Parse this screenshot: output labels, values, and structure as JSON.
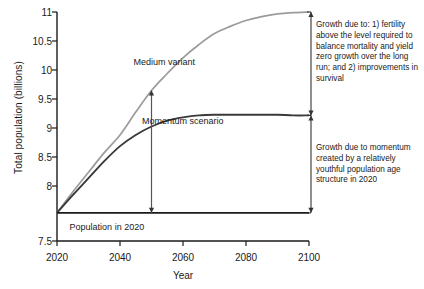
{
  "chart_data": {
    "type": "line",
    "title": "",
    "xlabel": "Year",
    "ylabel": "Total population (billions)",
    "xlim": [
      2020,
      2100
    ],
    "ylim": [
      7.5,
      11
    ],
    "grid": false,
    "legend_position": "inline-labels",
    "xticks": [
      "2020",
      "2040",
      "2060",
      "2080",
      "2100"
    ],
    "xtick_values": [
      2020,
      2040,
      2060,
      2080,
      2100
    ],
    "yticks": [
      "7.5",
      "8",
      "8.5",
      "9",
      "9.5",
      "10",
      "10.5",
      "11"
    ],
    "ytick_values": [
      7.5,
      8,
      8.5,
      9,
      9.5,
      10,
      10.5,
      11
    ],
    "x": [
      2020,
      2025,
      2030,
      2035,
      2040,
      2045,
      2050,
      2055,
      2060,
      2065,
      2070,
      2075,
      2080,
      2085,
      2090,
      2095,
      2100
    ],
    "series": [
      {
        "name": "Medium variant",
        "color": "#9b9b9b",
        "values": [
          7.93,
          8.25,
          8.55,
          8.85,
          9.12,
          9.47,
          9.8,
          10.06,
          10.3,
          10.5,
          10.67,
          10.78,
          10.87,
          10.93,
          10.97,
          10.99,
          11.0
        ]
      },
      {
        "name": "Momentum scenario",
        "color": "#3a3a3a",
        "values": [
          7.93,
          8.2,
          8.46,
          8.72,
          8.95,
          9.12,
          9.25,
          9.34,
          9.39,
          9.42,
          9.43,
          9.43,
          9.43,
          9.43,
          9.43,
          9.42,
          9.42
        ]
      },
      {
        "name": "Population in 2020",
        "color": "#1a1a1a",
        "values": [
          7.93,
          7.93,
          7.93,
          7.93,
          7.93,
          7.93,
          7.93,
          7.93,
          7.93,
          7.93,
          7.93,
          7.93,
          7.93,
          7.93,
          7.93,
          7.93,
          7.93
        ]
      }
    ],
    "annotations": [
      {
        "id": "medium-variant-label",
        "text": "Medium variant",
        "x": 2050,
        "y": 10.22
      },
      {
        "id": "momentum-scenario-label",
        "text": "Momentum scenario",
        "x": 2066,
        "y": 9.33
      },
      {
        "id": "population-2020-label",
        "text": "Population in 2020",
        "x": 2024,
        "y": 7.82
      },
      {
        "id": "fertility-note",
        "text": "Growth due to: 1) fertility above the level required to balance mortality and yield zero growth over the long run; and 2) improvements in survival",
        "bracket_from": 9.42,
        "bracket_to": 11.0,
        "at_x": 2100
      },
      {
        "id": "momentum-note",
        "text": "Growth due to momentum created by a relatively youthful population age structure in 2020",
        "bracket_from": 7.93,
        "bracket_to": 9.42,
        "at_x": 2100
      }
    ],
    "arrow_marker": {
      "id": "arrow-2050",
      "x": 2050,
      "from": 7.93,
      "to": 9.8,
      "double_headed": true
    }
  }
}
